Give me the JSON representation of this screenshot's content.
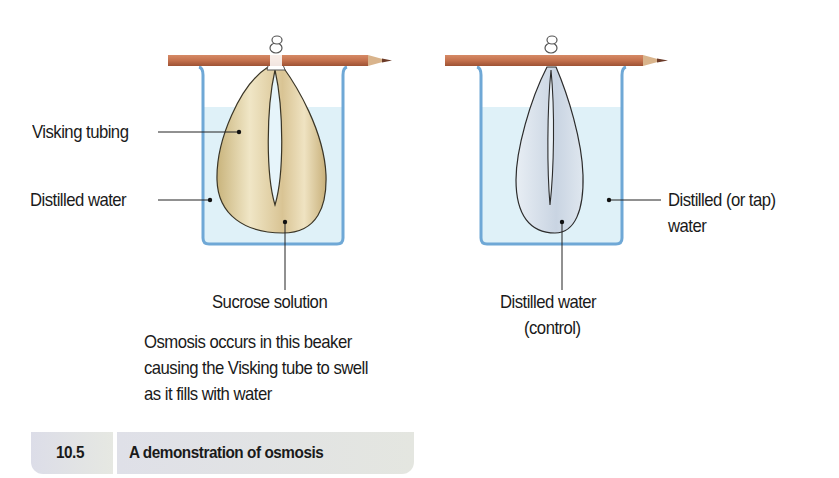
{
  "figure": {
    "number": "10.5",
    "title": "A demonstration of osmosis"
  },
  "left_beaker": {
    "labels": {
      "visking_tubing": "Visking tubing",
      "distilled_water": "Distilled water",
      "sucrose_solution": "Sucrose solution"
    },
    "note_lines": [
      "Osmosis occurs in this beaker",
      "causing the Visking tube to swell",
      "as it fills with water"
    ]
  },
  "right_beaker": {
    "labels": {
      "outer_water_line1": "Distilled (or tap)",
      "outer_water_line2": "water",
      "inner_water_line1": "Distilled water",
      "inner_water_line2": "(control)"
    }
  },
  "colors": {
    "beaker_outline": "#6fa8d6",
    "water": "#dff1f8",
    "pencil": "#c0704e",
    "sucrose_fill": "#dccc9a",
    "control_fill": "#d8e2ec"
  }
}
